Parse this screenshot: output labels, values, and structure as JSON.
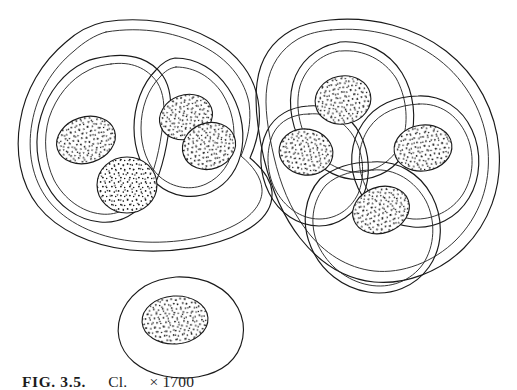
{
  "figure": {
    "caption": {
      "label": "FIG. 3.5.",
      "description": "Cl.",
      "magnification": "× 1700",
      "full_text": "FIG. 3.5.   Cl.   × 1700"
    },
    "medium": "ink line drawing, stippled shading",
    "colors": {
      "background": "#ffffff",
      "line": "#1a1a1a",
      "stipple": "#111111"
    },
    "groups": [
      {
        "name": "left-cluster",
        "label": "left cell cluster",
        "compartments": 2,
        "spore_count": 4,
        "envelope_walls": 2
      },
      {
        "name": "right-cluster",
        "label": "right cell cluster",
        "compartments": 4,
        "spore_count": 4,
        "envelope_walls": 2
      },
      {
        "name": "single-cell",
        "label": "isolated single cell",
        "compartments": 1,
        "spore_count": 1,
        "envelope_walls": 1
      }
    ],
    "spores": [
      {
        "id": "spore-l1",
        "group": "left-cluster",
        "cx": 86,
        "cy": 140,
        "rx": 30,
        "ry": 23,
        "rot": -18
      },
      {
        "id": "spore-l2",
        "group": "left-cluster",
        "cx": 127,
        "cy": 185,
        "rx": 30,
        "ry": 28,
        "rot": 0
      },
      {
        "id": "spore-l3",
        "group": "left-cluster",
        "cx": 186,
        "cy": 117,
        "rx": 27,
        "ry": 22,
        "rot": -20
      },
      {
        "id": "spore-l4",
        "group": "left-cluster",
        "cx": 209,
        "cy": 146,
        "rx": 27,
        "ry": 23,
        "rot": -20
      },
      {
        "id": "spore-r1",
        "group": "right-cluster",
        "cx": 343,
        "cy": 100,
        "rx": 28,
        "ry": 24,
        "rot": -12
      },
      {
        "id": "spore-r2",
        "group": "right-cluster",
        "cx": 306,
        "cy": 152,
        "rx": 27,
        "ry": 23,
        "rot": 10
      },
      {
        "id": "spore-r3",
        "group": "right-cluster",
        "cx": 423,
        "cy": 148,
        "rx": 29,
        "ry": 23,
        "rot": -8
      },
      {
        "id": "spore-r4",
        "group": "right-cluster",
        "cx": 381,
        "cy": 210,
        "rx": 29,
        "ry": 23,
        "rot": -20
      },
      {
        "id": "spore-s1",
        "group": "single-cell",
        "cx": 175,
        "cy": 320,
        "rx": 33,
        "ry": 24,
        "rot": -4
      }
    ]
  }
}
